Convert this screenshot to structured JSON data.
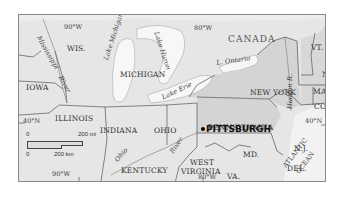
{
  "map": {
    "title": "Pittsburgh regional map",
    "country_label": "CANADA",
    "states": {
      "wis": "WIS.",
      "iowa": "IOWA",
      "michigan": "MICHIGAN",
      "illinois": "ILLINOIS",
      "indiana": "INDIANA",
      "ohio": "OHIO",
      "kentucky": "KENTUCKY",
      "west_virginia_1": "WEST",
      "west_virginia_2": "VIRGINIA",
      "virginia": "VA.",
      "maryland": "MD.",
      "delaware": "DEL.",
      "new_jersey": "N.J.",
      "pennsylvania": "PENNSYLVANIA",
      "new_york": "NEW YORK",
      "vermont": "VT.",
      "new_hampshire": "N.H.",
      "massachusetts": "MASS.",
      "connecticut": "CONN."
    },
    "water": {
      "lake_michigan": "Lake Michigan",
      "lake_huron": "Lake Huron",
      "lake_erie": "Lake Erie",
      "lake_ontario": "L. Ontario",
      "mississippi_1": "Mississippi",
      "mississippi_2": "River",
      "ohio_river_1": "Ohio",
      "ohio_river_2": "River",
      "hudson": "Hudson R.",
      "atlantic_1": "ATLANTIC",
      "atlantic_2": "OCEAN"
    },
    "coordinates": {
      "top_90w": "90°W",
      "top_80w": "80°W",
      "bottom_90w": "90°W",
      "bottom_80w": "80°W",
      "left_40n": "40°N",
      "right_40n": "40°N"
    },
    "city": {
      "name": "PITTSBURGH"
    },
    "scale": {
      "mi_start": "0",
      "mi_end": "200 mi",
      "km_start": "0",
      "km_end": "200 km"
    }
  },
  "colors": {
    "land": "#e6e6e6",
    "state_highlight": "#d4d4d4",
    "water": "#f7f7f7",
    "border": "#555555"
  }
}
